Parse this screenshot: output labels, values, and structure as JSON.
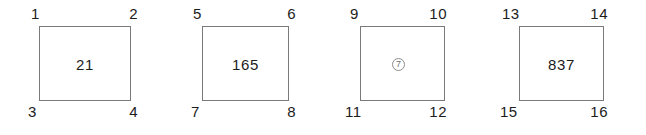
{
  "figure": {
    "background_color": "#ffffff",
    "border_color": "#7a7a7a",
    "text_color": "#1c1c1c",
    "cells": [
      {
        "id": "cell-1",
        "value": "21",
        "value_type": "number",
        "corner_labels": {
          "top_left": "1",
          "top_right": "2",
          "bottom_left": "3",
          "bottom_right": "4"
        }
      },
      {
        "id": "cell-2",
        "value": "165",
        "value_type": "number",
        "corner_labels": {
          "top_left": "5",
          "top_right": "6",
          "bottom_left": "7",
          "bottom_right": "8"
        }
      },
      {
        "id": "cell-3",
        "value": "7",
        "value_type": "circled-symbol",
        "corner_labels": {
          "top_left": "9",
          "top_right": "10",
          "bottom_left": "11",
          "bottom_right": "12"
        }
      },
      {
        "id": "cell-4",
        "value": "837",
        "value_type": "number",
        "corner_labels": {
          "top_left": "13",
          "top_right": "14",
          "bottom_left": "15",
          "bottom_right": "16"
        }
      }
    ]
  }
}
